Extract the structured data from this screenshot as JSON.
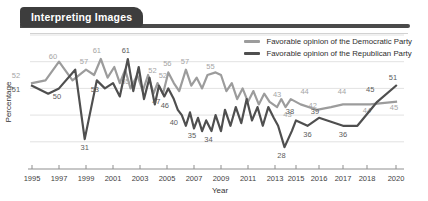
{
  "header": {
    "tab_label": "Interpreting Images"
  },
  "legend": [
    {
      "label": "Favorable opinion of the Democratic Party",
      "color": "#9c9c9c"
    },
    {
      "label": "Favorable opinion of the Republican Party",
      "color": "#4f4f4f"
    }
  ],
  "chart_data": {
    "type": "line",
    "title": "Interpreting Images",
    "xlabel": "Year",
    "ylabel": "Percentage",
    "x_ticks": [
      "1995",
      "1997",
      "1999",
      "2001",
      "2003",
      "2005",
      "2007",
      "2009",
      "2011",
      "2013",
      "2015",
      "2016",
      "2017",
      "2018",
      "2020"
    ],
    "ylim": [
      20,
      70
    ],
    "gridlines": [
      30,
      40,
      50,
      60,
      70
    ],
    "grid": true,
    "legend_position": "top-right",
    "series": [
      {
        "name": "Favorable opinion of the Democratic Party",
        "color": "#9c9c9c",
        "label_color": "#a6a6a6",
        "labeled_values": [
          52,
          60,
          57,
          61,
          55,
          52,
          56,
          52,
          57,
          55,
          43,
          43,
          44,
          42,
          44,
          44,
          45
        ],
        "points": [
          [
            1995,
            52,
            "52",
            -16,
            -7
          ],
          [
            1996,
            53
          ],
          [
            1997,
            60,
            "60",
            -6,
            -5
          ],
          [
            1998,
            53
          ],
          [
            1999,
            57,
            "57",
            -2,
            -8
          ],
          [
            1999.6,
            55
          ],
          [
            2000.1,
            61,
            "61",
            -4,
            -8
          ],
          [
            2000.6,
            54
          ],
          [
            2001.1,
            58
          ],
          [
            2001.5,
            52
          ],
          [
            2001.9,
            57
          ],
          [
            2002.3,
            50
          ],
          [
            2002.8,
            55,
            "55",
            -12,
            7
          ],
          [
            2003.2,
            49
          ],
          [
            2003.6,
            55
          ],
          [
            2004,
            48
          ],
          [
            2004.3,
            52,
            "52",
            -5,
            -12
          ],
          [
            2004.7,
            48
          ],
          [
            2005.1,
            56,
            "56",
            -1,
            -8
          ],
          [
            2005.5,
            52,
            "52",
            -11,
            -7
          ],
          [
            2005.9,
            49
          ],
          [
            2006.4,
            57,
            "57",
            -1,
            -8
          ],
          [
            2006.8,
            51
          ],
          [
            2007.2,
            54
          ],
          [
            2007.6,
            50
          ],
          [
            2008,
            55,
            "55",
            3,
            -8
          ],
          [
            2008.6,
            56
          ],
          [
            2009,
            55
          ],
          [
            2009.4,
            49
          ],
          [
            2009.8,
            52
          ],
          [
            2010.2,
            46
          ],
          [
            2010.6,
            50
          ],
          [
            2011,
            45
          ],
          [
            2011.4,
            49
          ],
          [
            2011.8,
            44
          ],
          [
            2012.2,
            48
          ],
          [
            2012.6,
            45
          ],
          [
            2013.2,
            43,
            "43",
            0,
            -12
          ],
          [
            2013.6,
            46
          ],
          [
            2014,
            43,
            "43",
            2,
            8
          ],
          [
            2014.5,
            46
          ],
          [
            2015.2,
            44,
            "44",
            4,
            -12
          ],
          [
            2015.9,
            42,
            "42",
            -4,
            -4
          ],
          [
            2016.5,
            43
          ],
          [
            2017,
            44,
            "44",
            -1,
            -12
          ],
          [
            2018.2,
            44,
            "44",
            -3,
            7
          ],
          [
            2020,
            45,
            "45",
            -2,
            6
          ]
        ]
      },
      {
        "name": "Favorable opinion of the Republican Party",
        "color": "#4f4f4f",
        "label_color": "#5c5c5c",
        "labeled_values": [
          51,
          50,
          31,
          53,
          61,
          47,
          46,
          40,
          35,
          34,
          28,
          38,
          36,
          39,
          36,
          45,
          51
        ],
        "points": [
          [
            1995,
            51,
            "51",
            -16,
            4
          ],
          [
            1996.2,
            48
          ],
          [
            1997,
            50,
            "50",
            -2,
            9
          ],
          [
            1998.2,
            57
          ],
          [
            1998.9,
            31,
            "31",
            0,
            9
          ],
          [
            1999.8,
            53,
            "53",
            -2,
            10
          ],
          [
            2000.4,
            50
          ],
          [
            2001,
            52
          ],
          [
            2001.5,
            47
          ],
          [
            2002.1,
            61,
            "61",
            -2,
            -8
          ],
          [
            2002.5,
            49
          ],
          [
            2002.9,
            58
          ],
          [
            2003.3,
            46
          ],
          [
            2003.7,
            54
          ],
          [
            2004.1,
            44
          ],
          [
            2004.4,
            51
          ],
          [
            2004.8,
            47,
            "47",
            -8,
            6
          ],
          [
            2005.1,
            50
          ],
          [
            2005.5,
            46,
            "46",
            -9,
            7
          ],
          [
            2005.8,
            42
          ],
          [
            2006.1,
            40,
            "40",
            -8,
            8
          ],
          [
            2006.4,
            36
          ],
          [
            2006.7,
            41
          ],
          [
            2007,
            35,
            "35",
            -2,
            8
          ],
          [
            2007.3,
            39
          ],
          [
            2007.6,
            34
          ],
          [
            2007.9,
            38
          ],
          [
            2008.3,
            34,
            "34",
            -3,
            9
          ],
          [
            2008.6,
            40
          ],
          [
            2009,
            34
          ],
          [
            2009.3,
            42
          ],
          [
            2009.7,
            36
          ],
          [
            2010.1,
            43
          ],
          [
            2010.5,
            37
          ],
          [
            2010.9,
            46
          ],
          [
            2011.3,
            38
          ],
          [
            2011.7,
            43
          ],
          [
            2012.1,
            36
          ],
          [
            2012.5,
            43
          ],
          [
            2012.9,
            39
          ],
          [
            2013.3,
            36
          ],
          [
            2013.9,
            28,
            "28",
            -3,
            9
          ],
          [
            2014.6,
            34
          ],
          [
            2015,
            38,
            "38",
            -6,
            -8
          ],
          [
            2015.5,
            36,
            "36",
            0,
            9
          ],
          [
            2016,
            39,
            "39",
            -4,
            -6
          ],
          [
            2017,
            36,
            "36",
            0,
            9
          ],
          [
            2017.6,
            36
          ],
          [
            2018.7,
            45,
            "45",
            -7,
            -12
          ],
          [
            2020,
            51,
            "51",
            -3,
            -8
          ]
        ]
      }
    ],
    "colors": {
      "grid": "#e2e2e2",
      "axis": "#8f8f8f",
      "tick_text": "#3f3f3f"
    }
  }
}
